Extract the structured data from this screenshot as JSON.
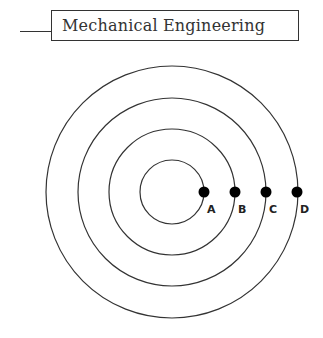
{
  "header": {
    "title": "Mechanical Engineering"
  },
  "diagram": {
    "center": {
      "x": 172,
      "y": 192
    },
    "circles": [
      {
        "r": 32
      },
      {
        "r": 63
      },
      {
        "r": 94
      },
      {
        "r": 126
      }
    ],
    "points": [
      {
        "label": "A",
        "x": 204,
        "y": 192
      },
      {
        "label": "B",
        "x": 235,
        "y": 192
      },
      {
        "label": "C",
        "x": 266,
        "y": 192
      },
      {
        "label": "D",
        "x": 297,
        "y": 192
      }
    ],
    "colors": {
      "stroke": "#333333",
      "dot": "#000000"
    }
  }
}
